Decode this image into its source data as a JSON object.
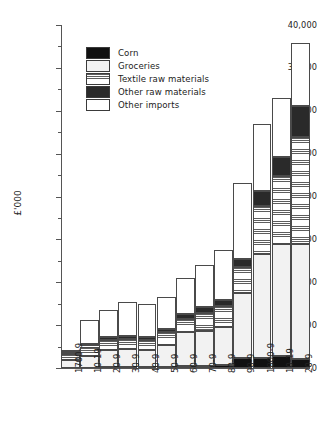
{
  "chart_data": {
    "type": "bar",
    "stacked": true,
    "title": "",
    "subtitle": "",
    "xlabel": "",
    "ylabel": "£'000",
    "ylim": [
      0,
      40000
    ],
    "ytick_step": 5000,
    "yminor_step": 2500,
    "grid": false,
    "legend_position": "upper-left-inside",
    "categories": [
      "1700-9",
      "10-19",
      "20-9",
      "30-9",
      "40-9",
      "50-9",
      "60-9",
      "70-9",
      "80-9",
      "90-9",
      "1800-9",
      "10-19",
      "20-9"
    ],
    "ytick_labels": [
      "0",
      "5000",
      "10,000",
      "15,000",
      "20,000",
      "25,000",
      "30,000",
      "35,000",
      "40,000"
    ],
    "ytick_values": [
      0,
      5000,
      10000,
      15000,
      20000,
      25000,
      30000,
      35000,
      40000
    ],
    "series": [
      {
        "name": "Corn",
        "fill": "corn-black",
        "values": [
          60,
          60,
          120,
          100,
          90,
          120,
          250,
          200,
          300,
          1150,
          1200,
          1350,
          1100
        ]
      },
      {
        "name": "Groceries",
        "fill": "groceries-light-stipple",
        "values": [
          840,
          1350,
          1950,
          2100,
          2050,
          2550,
          3900,
          4150,
          4450,
          7550,
          12150,
          13100,
          13400
        ]
      },
      {
        "name": "Textile raw materials",
        "fill": "textile-horizontal-lines",
        "values": [
          700,
          1100,
          1150,
          1150,
          1100,
          1500,
          1550,
          2100,
          2450,
          3100,
          5600,
          7900,
          12400
        ]
      },
      {
        "name": "Other raw materials",
        "fill": "other-raw-dark-stipple",
        "values": [
          300,
          250,
          350,
          400,
          350,
          400,
          600,
          650,
          750,
          900,
          1650,
          2300,
          3700
        ]
      },
      {
        "name": "Other imports",
        "fill": "other-imports-white",
        "values": [
          100,
          2800,
          3150,
          3950,
          3850,
          3750,
          4150,
          4900,
          5850,
          8900,
          7900,
          6850,
          7350
        ]
      }
    ],
    "totals": [
      2000,
      5560,
      6720,
      7700,
      7440,
      8320,
      10450,
      12000,
      13800,
      21600,
      28500,
      31500,
      37950
    ]
  },
  "legend": {
    "items": [
      {
        "label": "Corn",
        "swatch": "corn-black"
      },
      {
        "label": "Groceries",
        "swatch": "groceries-light-stipple"
      },
      {
        "label": "Textile raw materials",
        "swatch": "textile-horizontal-lines"
      },
      {
        "label": "Other raw materials",
        "swatch": "other-raw-dark-stipple"
      },
      {
        "label": "Other imports",
        "swatch": "other-imports-white"
      }
    ]
  }
}
